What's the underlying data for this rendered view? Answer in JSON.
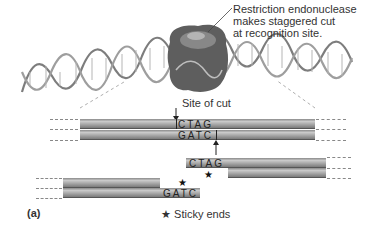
{
  "figure": {
    "panel_label": "(a)",
    "enzyme_label": [
      "Restriction endonuclease",
      "makes staggered cut",
      "at recognition site."
    ],
    "site_of_cut_label": "Site of cut",
    "legend": {
      "symbol": "★",
      "text": "Sticky ends"
    },
    "intact_dna": {
      "top_sequence": "CTAG",
      "bottom_sequence": "GATC"
    },
    "right_fragment": {
      "overhang_sequence": "CTAG",
      "star": "★"
    },
    "left_fragment": {
      "overhang_sequence": "GATC",
      "star": "★"
    },
    "colors": {
      "strand": "#a5a5a5",
      "protein": "#6b6b6b",
      "helix": "#9a9a9a"
    }
  }
}
